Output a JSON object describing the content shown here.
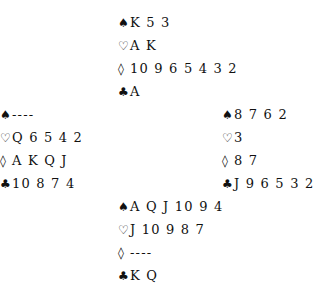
{
  "suits": {
    "spades": "♠",
    "hearts": "♡",
    "diamonds": "◊",
    "clubs": "♣"
  },
  "hands": {
    "north": {
      "spades": "K 5 3",
      "hearts": "A K",
      "diamonds": "10 9 6 5 4 3 2",
      "clubs": "A"
    },
    "west": {
      "spades": "----",
      "hearts": "Q 6 5 4 2",
      "diamonds": "A K Q J",
      "clubs": "10 8 7 4"
    },
    "east": {
      "spades": "8 7 6 2",
      "hearts": "3",
      "diamonds": "8 7",
      "clubs": "J 9 6 5 3 2"
    },
    "south": {
      "spades": "A Q J 10 9 4",
      "hearts": "J 10 9 8 7",
      "diamonds": "----",
      "clubs": "K Q"
    }
  }
}
